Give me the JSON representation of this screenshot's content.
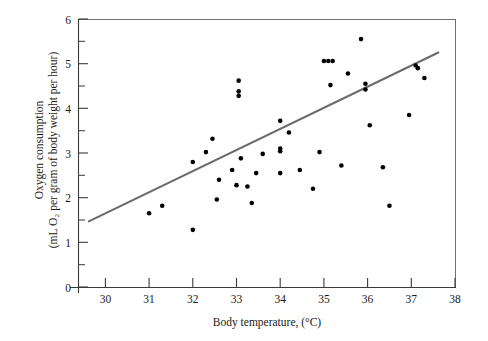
{
  "chart_data": {
    "type": "scatter",
    "title": "",
    "xlabel": "Body temperature, (°C)",
    "ylabel_line1": "Oxygen consumption",
    "ylabel_line2": "(mL O₂ per gram of body weight per hour)",
    "xlim": [
      29.0,
      38.0
    ],
    "ylim": [
      0,
      6
    ],
    "x_ticks": [
      30,
      31,
      32,
      33,
      34,
      35,
      36,
      37,
      38
    ],
    "x_tick_labels": [
      "30",
      "31",
      "32",
      "33",
      "34",
      "35",
      "36",
      "37",
      "38"
    ],
    "y_ticks": [
      0,
      1,
      2,
      3,
      4,
      5,
      6
    ],
    "y_tick_labels": [
      "0",
      "1",
      "2",
      "3",
      "4",
      "5",
      "6"
    ],
    "y_minor_ticks": [
      0.5,
      1.5,
      2.5,
      3.5,
      4.5,
      5.5
    ],
    "grid": false,
    "legend": null,
    "point_color": "#000000",
    "trendline_color": "#6b6b6b",
    "axis_color": "#3a3a3a",
    "points": [
      [
        31.0,
        1.65
      ],
      [
        31.3,
        1.82
      ],
      [
        32.0,
        1.28
      ],
      [
        32.0,
        2.8
      ],
      [
        32.3,
        3.02
      ],
      [
        32.45,
        3.32
      ],
      [
        32.55,
        1.96
      ],
      [
        32.6,
        2.4
      ],
      [
        32.9,
        2.62
      ],
      [
        33.0,
        2.28
      ],
      [
        33.05,
        4.62
      ],
      [
        33.05,
        4.38
      ],
      [
        33.05,
        4.28
      ],
      [
        33.1,
        2.88
      ],
      [
        33.25,
        2.25
      ],
      [
        33.35,
        1.88
      ],
      [
        33.45,
        2.55
      ],
      [
        33.6,
        2.98
      ],
      [
        34.0,
        3.72
      ],
      [
        34.0,
        3.1
      ],
      [
        34.0,
        3.04
      ],
      [
        34.0,
        2.55
      ],
      [
        34.2,
        3.46
      ],
      [
        34.45,
        2.62
      ],
      [
        34.75,
        2.2
      ],
      [
        34.9,
        3.02
      ],
      [
        35.0,
        5.06
      ],
      [
        35.1,
        5.06
      ],
      [
        35.2,
        5.06
      ],
      [
        35.15,
        4.52
      ],
      [
        35.55,
        4.78
      ],
      [
        35.4,
        2.72
      ],
      [
        35.85,
        5.55
      ],
      [
        35.95,
        4.55
      ],
      [
        35.95,
        4.42
      ],
      [
        36.05,
        3.62
      ],
      [
        36.35,
        2.68
      ],
      [
        36.5,
        1.82
      ],
      [
        36.95,
        3.85
      ],
      [
        37.1,
        4.96
      ],
      [
        37.15,
        4.9
      ],
      [
        37.3,
        4.68
      ]
    ],
    "trendline": {
      "x_start": 29.62,
      "y_start": 1.47,
      "x_end": 37.62,
      "y_end": 5.25
    }
  }
}
